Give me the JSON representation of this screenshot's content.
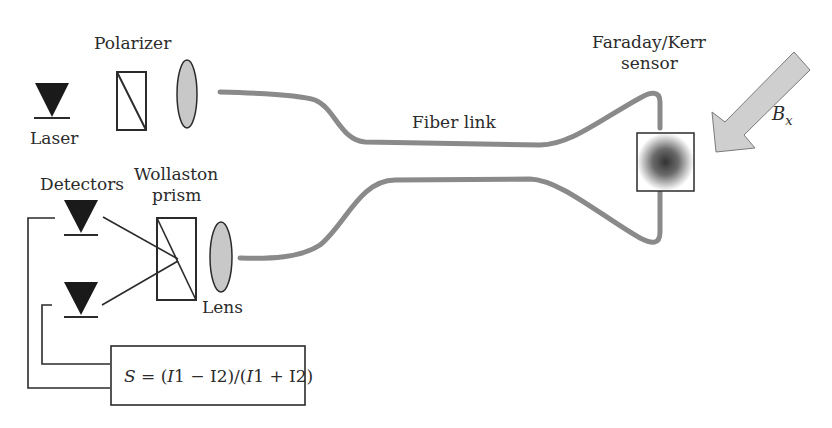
{
  "labels": {
    "polarizer": "Polarizer",
    "laser": "Laser",
    "detectors": "Detectors",
    "wollaston_line1": "Wollaston",
    "wollaston_line2": "prism",
    "lens": "Lens",
    "fiber_link": "Fiber link",
    "sensor_line1": "Faraday/Kerr",
    "sensor_line2": "sensor",
    "field_symbol": "B",
    "field_subscript": "x"
  },
  "formula": {
    "text": "S = (I1 − I2)/(I1 + I2)",
    "lhs": "S",
    "eq": " = (",
    "i1a": "I",
    "rest1": "1 − I2)/(",
    "i1b": "I",
    "rest2": "1 + I2)"
  },
  "colors": {
    "ink": "#2b2b2b",
    "fiber": "#8a8a8a",
    "lens_fill": "#c8c8c8",
    "arrow_fill": "#cfcfcf",
    "sensor_core": "#3a3a3a"
  }
}
